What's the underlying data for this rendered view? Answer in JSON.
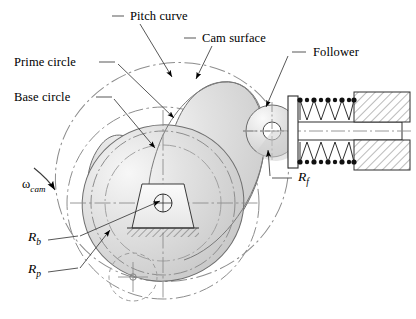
{
  "figure": {
    "background_color": "#ffffff",
    "line_color": "#000000",
    "construction_line_color": "#8a8a8a",
    "cam_fill_light": "#f2f2f2",
    "cam_fill_mid": "#d8d8d8",
    "cam_fill_dark": "#c2c2c2"
  },
  "labels": {
    "pitch_curve": "Pitch curve",
    "cam_surface": "Cam surface",
    "prime_circle": "Prime circle",
    "base_circle": "Base circle",
    "follower": "Follower",
    "omega_cam_symbol": "ω",
    "omega_cam_subscript": "cam",
    "r_b_symbol": "R",
    "r_b_subscript": "b",
    "r_p_symbol": "R",
    "r_p_subscript": "p",
    "r_f_symbol": "R",
    "r_f_subscript": "f"
  },
  "parts": {
    "cam_lobe": "cam-lobe",
    "base_circle_arc": "base-circle",
    "prime_circle_arc": "prime-circle",
    "pitch_curve_outline": "pitch-curve",
    "cam_hub": "cam-hub",
    "hub_center": "hub-center",
    "keyway_trapezoid": "keyway",
    "ground_hatch": "ground-hatching",
    "roller_follower": "roller-follower",
    "roller_center": "roller-center",
    "roller_home_position": "roller-home-dashed",
    "follower_plate": "follower-plate",
    "spring": "return-spring",
    "housing_upper": "housing-block-upper",
    "housing_lower": "housing-block-lower",
    "follower_stem": "follower-stem",
    "rotation_arrow": "cam-rotation-arrow"
  }
}
